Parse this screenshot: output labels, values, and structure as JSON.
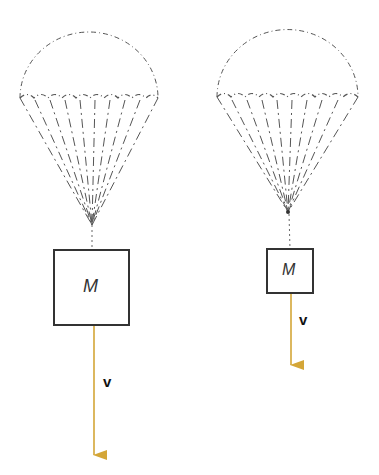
{
  "figure": {
    "colors": {
      "canopy": "#555555",
      "box": "#333333",
      "arrow": "#d4a637",
      "background": "#ffffff"
    },
    "parachutes": [
      {
        "id": "left",
        "mass_label": "M",
        "velocity_label": "v",
        "box_size": "large",
        "arrow_length": "long"
      },
      {
        "id": "right",
        "mass_label": "M",
        "velocity_label": "v",
        "box_size": "small",
        "arrow_length": "short"
      }
    ]
  }
}
